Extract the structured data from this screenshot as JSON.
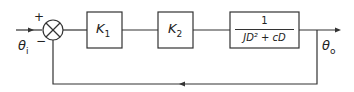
{
  "diagram": {
    "input": {
      "symbol": "θ",
      "subscript": "i"
    },
    "output": {
      "symbol": "θ",
      "subscript": "o"
    },
    "summing_junction": {
      "plus": "+",
      "minus": "−"
    },
    "blocks": [
      {
        "symbol": "K",
        "subscript": "1"
      },
      {
        "symbol": "K",
        "subscript": "2"
      },
      {
        "numerator": "1",
        "denominator": "JD² + cD"
      }
    ],
    "colors": {
      "line": "#333333",
      "background": "#ffffff"
    }
  }
}
